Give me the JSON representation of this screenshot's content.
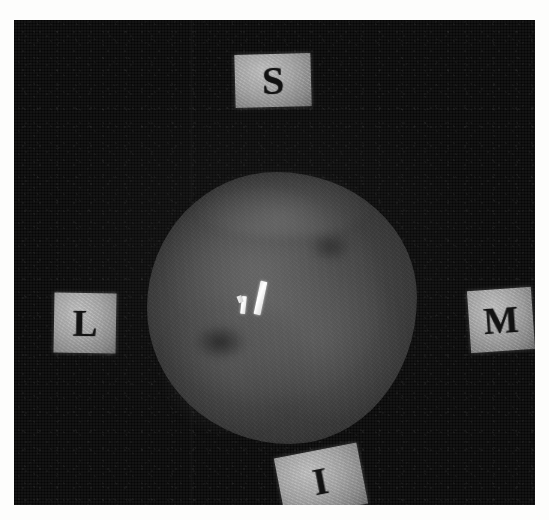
{
  "image": {
    "kind": "specimen-radiograph",
    "background_color": "#fdfdfc",
    "plate_color": "#060606",
    "specimen_color": "#444444",
    "marker_tile_color": "#a7a7a7",
    "clip_color": "#ffffff"
  },
  "specimen": {
    "label": "tissue-specimen-mass"
  },
  "clips": [
    {
      "name": "long-metallic-clip",
      "label": ""
    },
    {
      "name": "short-metallic-clip",
      "label": ""
    }
  ],
  "markers": {
    "superior": {
      "letter": "S",
      "position": "top"
    },
    "lateral": {
      "letter": "L",
      "position": "left"
    },
    "medial": {
      "letter": "M",
      "position": "right"
    },
    "inferior": {
      "letter": "I",
      "position": "bottom"
    }
  }
}
